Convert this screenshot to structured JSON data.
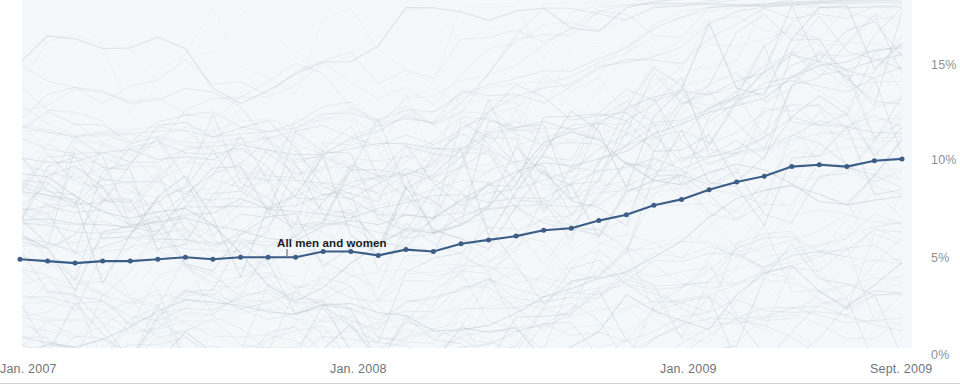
{
  "chart_data": {
    "type": "line",
    "title": "",
    "subtitle": "",
    "xlabel": "",
    "ylabel": "",
    "ylim": [
      0,
      17
    ],
    "yticks": [
      0,
      5,
      10,
      15
    ],
    "ytick_labels": [
      "0%",
      "5%",
      "10%",
      "15%"
    ],
    "grid": false,
    "legend_position": "inline-annotation",
    "x": [
      "Jan. 2007",
      "Feb. 2007",
      "Mar. 2007",
      "Apr. 2007",
      "May 2007",
      "Jun. 2007",
      "Jul. 2007",
      "Aug. 2007",
      "Sep. 2007",
      "Oct. 2007",
      "Nov. 2007",
      "Dec. 2007",
      "Jan. 2008",
      "Feb. 2008",
      "Mar. 2008",
      "Apr. 2008",
      "May 2008",
      "Jun. 2008",
      "Jul. 2008",
      "Aug. 2008",
      "Sep. 2008",
      "Oct. 2008",
      "Nov. 2008",
      "Dec. 2008",
      "Jan. 2009",
      "Feb. 2009",
      "Mar. 2009",
      "Apr. 2009",
      "May 2009",
      "Jun. 2009",
      "Jul. 2009",
      "Aug. 2009",
      "Sept. 2009"
    ],
    "xtick_labels": [
      "Jan. 2007",
      "Jan. 2008",
      "Jan. 2009",
      "Sept. 2009"
    ],
    "xtick_positions": [
      0,
      12,
      24,
      32
    ],
    "series": [
      {
        "name": "All men and women",
        "color": "#3c5e86",
        "marker": "circle",
        "annotation": "All men and women",
        "values": [
          4.6,
          4.5,
          4.4,
          4.5,
          4.5,
          4.6,
          4.7,
          4.6,
          4.7,
          4.7,
          4.7,
          5.0,
          5.0,
          4.8,
          5.1,
          5.0,
          5.4,
          5.6,
          5.8,
          6.1,
          6.2,
          6.6,
          6.9,
          7.4,
          7.7,
          8.2,
          8.6,
          8.9,
          9.4,
          9.5,
          9.4,
          9.7,
          9.8
        ]
      }
    ],
    "background_series_note": "many faint gray lines showing demographic subgroups",
    "colors": {
      "panel_background": "#f4f8fb",
      "page_background": "#ffffff",
      "highlight_line": "#3c5e86",
      "background_lines": "#b9c3cc",
      "ytick_text": "#8d9296",
      "xtick_text": "#70757a",
      "annotation_text": "#1c1c1c",
      "divider": "#d0d3d6"
    }
  },
  "axes": {
    "y_labels": [
      {
        "text": "15%",
        "top": 58
      },
      {
        "text": "10%",
        "top": 153
      },
      {
        "text": "5%",
        "top": 251
      },
      {
        "text": "0%",
        "top": 348
      }
    ],
    "x_labels": [
      {
        "text": "Jan. 2007",
        "left": 0
      },
      {
        "text": "Jan. 2008",
        "left": 330
      },
      {
        "text": "Jan. 2009",
        "left": 660
      },
      {
        "text": "Sept. 2009",
        "left": 870
      }
    ]
  },
  "annotation": {
    "label": "All men and women"
  }
}
